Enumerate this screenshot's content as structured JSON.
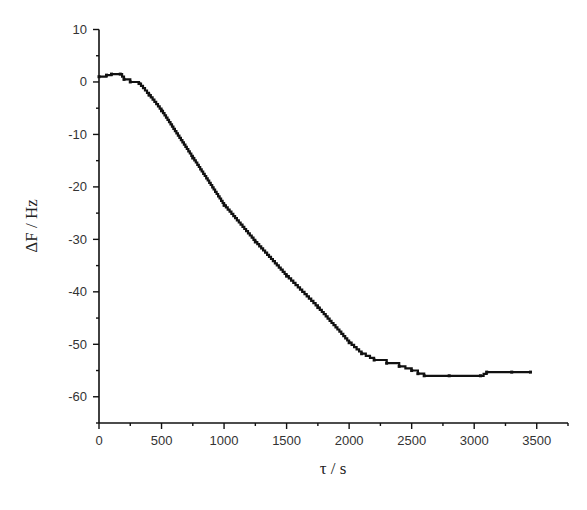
{
  "chart_data": {
    "type": "line",
    "title": "",
    "xlabel": "τ / s",
    "ylabel": "ΔF / Hz",
    "xlim": [
      0,
      3750
    ],
    "ylim": [
      -65,
      10
    ],
    "x_ticks": [
      0,
      500,
      1000,
      1500,
      2000,
      2500,
      3000,
      3500
    ],
    "x_tick_labels": [
      "0",
      "500",
      "1000",
      "1500",
      "2000",
      "2500",
      "3000",
      "3500"
    ],
    "x_minor_ticks": [
      250,
      750,
      1250,
      1750,
      2250,
      2750,
      3250,
      3750
    ],
    "y_ticks": [
      10,
      0,
      -10,
      -20,
      -30,
      -40,
      -50,
      -60
    ],
    "y_tick_labels": [
      "10",
      "0",
      "-10",
      "-20",
      "-30",
      "-40",
      "-50",
      "-60"
    ],
    "y_minor_ticks": [
      5,
      -5,
      -15,
      -25,
      -35,
      -45,
      -55,
      -65
    ],
    "grid": false,
    "legend": "none",
    "series": [
      {
        "name": "ΔF",
        "color": "#111111",
        "x": [
          0,
          60,
          100,
          170,
          200,
          250,
          320,
          400,
          500,
          750,
          1000,
          1250,
          1500,
          1750,
          2000,
          2100,
          2200,
          2300,
          2400,
          2500,
          2550,
          2600,
          2800,
          3050,
          3100,
          3300,
          3450
        ],
        "y": [
          1.0,
          1.3,
          1.5,
          1.5,
          0.5,
          0.0,
          -0.3,
          -2.5,
          -5.5,
          -14.5,
          -23.5,
          -30.5,
          -37.0,
          -43.0,
          -49.7,
          -51.8,
          -53.0,
          -53.6,
          -54.2,
          -55.0,
          -55.6,
          -56.0,
          -56.0,
          -56.0,
          -55.3,
          -55.3,
          -55.3
        ]
      }
    ]
  }
}
